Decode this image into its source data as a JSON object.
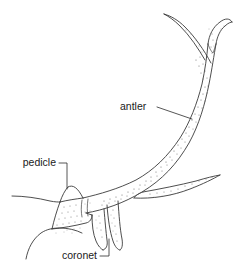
{
  "figure": {
    "background_color": "#ffffff",
    "line_color": "#3a3a3a",
    "text_color": "#1a1a1a",
    "stipple_color": "#6e6e6e",
    "width": 244,
    "height": 273
  },
  "labels": {
    "antler": "antler",
    "pedicle": "pedicle",
    "coronet": "coronet"
  },
  "parts": {
    "main_beam": "main-beam",
    "top_fork_tine": "top-fork-tine",
    "middle_tine": "middle-tine",
    "brow_tine": "brow-tine",
    "skull_outline": "skull-outline",
    "coronet_ridge": "coronet-ridge",
    "pedicle_base": "pedicle-base"
  }
}
